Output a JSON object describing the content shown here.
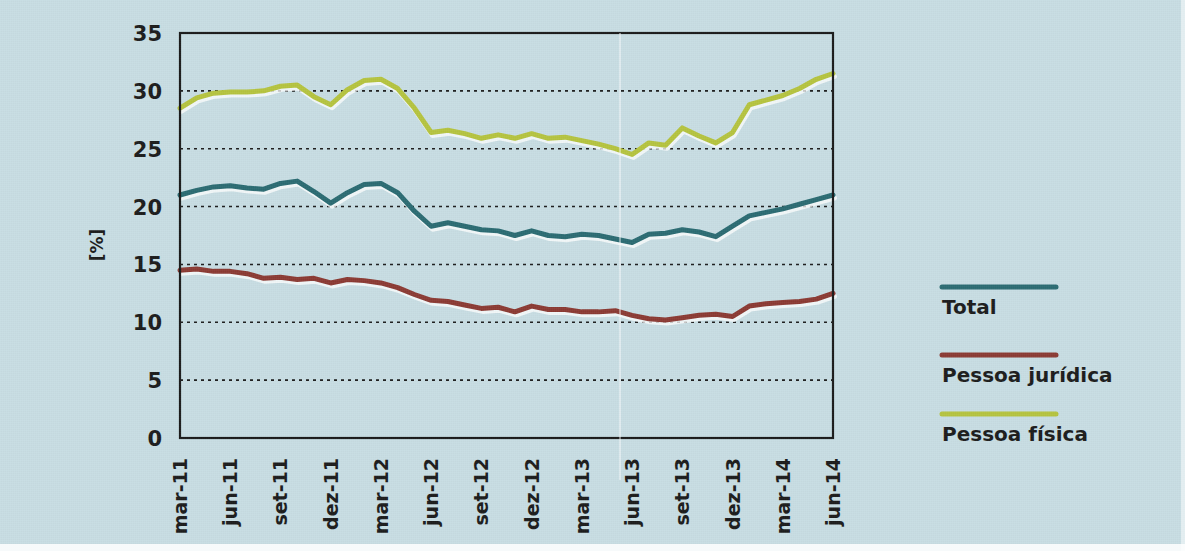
{
  "chart_data": {
    "type": "line",
    "title": "",
    "subtitle": "",
    "xlabel": "",
    "ylabel": "[%]",
    "ylim": [
      0,
      35
    ],
    "yticks": [
      0,
      5,
      10,
      15,
      20,
      25,
      30,
      35
    ],
    "grid": true,
    "legend_position": "right",
    "x": [
      "mar-11",
      "abr-11",
      "mai-11",
      "jun-11",
      "jul-11",
      "ago-11",
      "set-11",
      "out-11",
      "nov-11",
      "dez-11",
      "jan-12",
      "fev-12",
      "mar-12",
      "abr-12",
      "mai-12",
      "jun-12",
      "jul-12",
      "ago-12",
      "set-12",
      "out-12",
      "nov-12",
      "dez-12",
      "jan-13",
      "fev-13",
      "mar-13",
      "abr-13",
      "mai-13",
      "jun-13",
      "jul-13",
      "ago-13",
      "set-13",
      "out-13",
      "nov-13",
      "dez-13",
      "jan-14",
      "fev-14",
      "mar-14",
      "abr-14",
      "mai-14",
      "jun-14"
    ],
    "xtick_labels": [
      "mar-11",
      "jun-11",
      "set-11",
      "dez-11",
      "mar-12",
      "jun-12",
      "set-12",
      "dez-12",
      "mar-13",
      "jun-13",
      "set-13",
      "dez-13",
      "mar-14",
      "jun-14"
    ],
    "xtick_indices": [
      0,
      3,
      6,
      9,
      12,
      15,
      18,
      21,
      24,
      27,
      30,
      33,
      36,
      39
    ],
    "series": [
      {
        "name": "Total",
        "color": "#2a6b72",
        "values": [
          21.0,
          21.4,
          21.7,
          21.8,
          21.6,
          21.5,
          22.0,
          22.2,
          21.3,
          20.3,
          21.2,
          21.9,
          22.0,
          21.2,
          19.6,
          18.3,
          18.6,
          18.3,
          18.0,
          17.9,
          17.5,
          17.9,
          17.5,
          17.4,
          17.6,
          17.5,
          17.2,
          16.9,
          17.6,
          17.7,
          18.0,
          17.8,
          17.4,
          18.3,
          19.2,
          19.5,
          19.8,
          20.2,
          20.6,
          21.0
        ]
      },
      {
        "name": "Pessoa jurídica",
        "color": "#8b3a33",
        "values": [
          14.5,
          14.6,
          14.4,
          14.4,
          14.2,
          13.8,
          13.9,
          13.7,
          13.8,
          13.4,
          13.7,
          13.6,
          13.4,
          13.0,
          12.4,
          11.9,
          11.8,
          11.5,
          11.2,
          11.3,
          10.9,
          11.4,
          11.1,
          11.1,
          10.9,
          10.9,
          11.0,
          10.6,
          10.3,
          10.2,
          10.4,
          10.6,
          10.7,
          10.5,
          11.4,
          11.6,
          11.7,
          11.8,
          12.0,
          12.5
        ]
      },
      {
        "name": "Pessoa física",
        "color": "#b5c33f",
        "values": [
          28.5,
          29.4,
          29.8,
          29.9,
          29.9,
          30.0,
          30.4,
          30.5,
          29.5,
          28.8,
          30.1,
          30.9,
          31.0,
          30.2,
          28.5,
          26.4,
          26.6,
          26.3,
          25.9,
          26.2,
          25.9,
          26.3,
          25.9,
          26.0,
          25.7,
          25.4,
          25.0,
          24.5,
          25.5,
          25.3,
          26.8,
          26.1,
          25.5,
          26.4,
          28.8,
          29.2,
          29.6,
          30.2,
          31.0,
          31.5
        ]
      }
    ]
  },
  "legend": {
    "items": [
      {
        "label": "Total",
        "color": "#2a6b72"
      },
      {
        "label": "Pessoa jurídica",
        "color": "#8b3a33"
      },
      {
        "label": "Pessoa física",
        "color": "#b5c33f"
      }
    ]
  },
  "axes": {
    "y_label": "[%]",
    "y_tick_labels": [
      "0",
      "5",
      "10",
      "15",
      "20",
      "25",
      "30",
      "35"
    ]
  }
}
